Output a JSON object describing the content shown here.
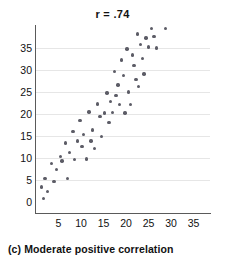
{
  "caption": "(c) Moderate positive correlation",
  "chart_data": {
    "type": "scatter",
    "title": "r = .74",
    "xlabel": "",
    "ylabel": "",
    "xlim": [
      0,
      37
    ],
    "ylim": [
      0,
      40
    ],
    "grid": true,
    "legend": null,
    "correlation": 0.74,
    "xticks": [
      5,
      10,
      15,
      20,
      25,
      30,
      35
    ],
    "yticks": [
      0,
      5,
      10,
      15,
      20,
      25,
      30,
      35
    ],
    "origin_label": "0",
    "marker_color": "#5c5c66",
    "axis_color": "#5a5a5a",
    "grid_color": "#e6e6e6",
    "points": [
      [
        1.2,
        3.4
      ],
      [
        1.6,
        0.8
      ],
      [
        2.0,
        5.4
      ],
      [
        2.6,
        2.4
      ],
      [
        3.4,
        8.7
      ],
      [
        4.0,
        4.6
      ],
      [
        4.6,
        7.4
      ],
      [
        5.4,
        10.4
      ],
      [
        5.8,
        9.3
      ],
      [
        6.6,
        13.4
      ],
      [
        7.0,
        5.3
      ],
      [
        7.4,
        11.3
      ],
      [
        8.2,
        16.0
      ],
      [
        8.6,
        9.6
      ],
      [
        9.2,
        13.9
      ],
      [
        9.8,
        18.5
      ],
      [
        10.2,
        12.6
      ],
      [
        10.6,
        15.3
      ],
      [
        11.2,
        9.8
      ],
      [
        11.8,
        20.5
      ],
      [
        12.2,
        13.9
      ],
      [
        12.6,
        16.4
      ],
      [
        13.0,
        12.2
      ],
      [
        13.6,
        22.3
      ],
      [
        14.2,
        19.4
      ],
      [
        14.6,
        14.9
      ],
      [
        15.2,
        20.2
      ],
      [
        15.8,
        24.8
      ],
      [
        16.2,
        18.1
      ],
      [
        16.6,
        22.8
      ],
      [
        17.0,
        20.4
      ],
      [
        17.4,
        29.6
      ],
      [
        17.8,
        24.2
      ],
      [
        18.2,
        26.6
      ],
      [
        18.6,
        22.2
      ],
      [
        19.0,
        32.3
      ],
      [
        19.4,
        28.8
      ],
      [
        19.8,
        20.2
      ],
      [
        20.2,
        34.8
      ],
      [
        20.6,
        25.0
      ],
      [
        21.0,
        22.2
      ],
      [
        21.4,
        33.4
      ],
      [
        21.8,
        31.0
      ],
      [
        22.2,
        27.9
      ],
      [
        22.6,
        38.2
      ],
      [
        22.8,
        26.2
      ],
      [
        23.2,
        35.8
      ],
      [
        23.6,
        32.6
      ],
      [
        24.0,
        29.1
      ],
      [
        24.4,
        37.3
      ],
      [
        25.0,
        35.2
      ],
      [
        25.6,
        39.4
      ],
      [
        26.2,
        37.6
      ],
      [
        26.8,
        35.0
      ],
      [
        28.8,
        39.4
      ]
    ]
  }
}
